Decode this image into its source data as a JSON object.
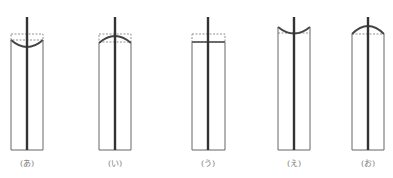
{
  "figure": {
    "colors": {
      "tube": "#555555",
      "rod": "#333333",
      "dashed": "#666666",
      "surface": "#444444"
    },
    "items": [
      {
        "label": "(あ)",
        "surface": "concave-below-dashed",
        "cx": 27
      },
      {
        "label": "(い)",
        "surface": "convex-below-dashed",
        "cx": 115
      },
      {
        "label": "(う)",
        "surface": "flat-below-dashed",
        "cx": 208
      },
      {
        "label": "(え)",
        "surface": "concave-above-dashed",
        "cx": 294
      },
      {
        "label": "(お)",
        "surface": "convex-above-dashed",
        "cx": 368
      }
    ]
  }
}
